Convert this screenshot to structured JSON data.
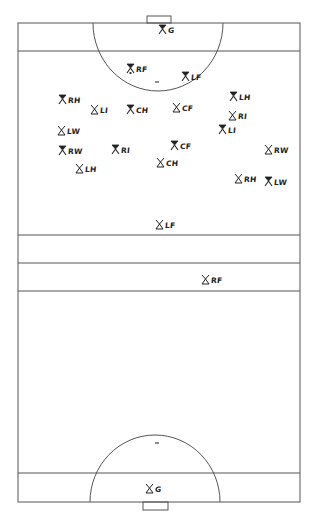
{
  "diagram": {
    "type": "field-hockey-formation",
    "colors": {
      "line": "#555555",
      "ink": "#222222",
      "background": "#ffffff"
    },
    "legend_note": "Filled symbol = attacking team; outline symbol = defending team",
    "players": [
      {
        "id": "p0",
        "label": "G",
        "team": "filled",
        "x": 158,
        "y": 23
      },
      {
        "id": "p1",
        "label": "RF",
        "team": "filled",
        "x": 126,
        "y": 62,
        "has_ball": true
      },
      {
        "id": "p2",
        "label": "LF",
        "team": "filled",
        "x": 181,
        "y": 70
      },
      {
        "id": "p3",
        "label": "RH",
        "team": "filled",
        "x": 58,
        "y": 93
      },
      {
        "id": "p4",
        "label": "LI",
        "team": "outline",
        "x": 90,
        "y": 103
      },
      {
        "id": "p5",
        "label": "CH",
        "team": "filled",
        "x": 126,
        "y": 103
      },
      {
        "id": "p6",
        "label": "CF",
        "team": "outline",
        "x": 172,
        "y": 101
      },
      {
        "id": "p7",
        "label": "LH",
        "team": "filled",
        "x": 229,
        "y": 90
      },
      {
        "id": "p8",
        "label": "RI",
        "team": "outline",
        "x": 228,
        "y": 109
      },
      {
        "id": "p9",
        "label": "LI",
        "team": "filled",
        "x": 218,
        "y": 123
      },
      {
        "id": "p10",
        "label": "LW",
        "team": "outline",
        "x": 57,
        "y": 124
      },
      {
        "id": "p11",
        "label": "RW",
        "team": "filled",
        "x": 58,
        "y": 144
      },
      {
        "id": "p12",
        "label": "RI",
        "team": "filled",
        "x": 111,
        "y": 143
      },
      {
        "id": "p13",
        "label": "CF",
        "team": "filled",
        "x": 170,
        "y": 139
      },
      {
        "id": "p14",
        "label": "CH",
        "team": "outline",
        "x": 156,
        "y": 156
      },
      {
        "id": "p15",
        "label": "LH",
        "team": "outline",
        "x": 75,
        "y": 162
      },
      {
        "id": "p16",
        "label": "RW",
        "team": "outline",
        "x": 264,
        "y": 143
      },
      {
        "id": "p17",
        "label": "RH",
        "team": "outline",
        "x": 234,
        "y": 172
      },
      {
        "id": "p18",
        "label": "LW",
        "team": "filled",
        "x": 264,
        "y": 175
      },
      {
        "id": "p19",
        "label": "LF",
        "team": "outline",
        "x": 155,
        "y": 218
      },
      {
        "id": "p20",
        "label": "RF",
        "team": "outline",
        "x": 201,
        "y": 273
      },
      {
        "id": "p21",
        "label": "G",
        "team": "outline",
        "x": 145,
        "y": 482
      }
    ]
  }
}
